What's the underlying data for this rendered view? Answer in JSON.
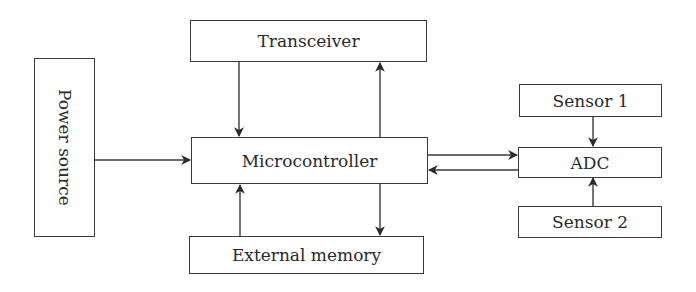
{
  "diagram": {
    "type": "block-diagram",
    "blocks": {
      "power_source": {
        "label": "Power source"
      },
      "transceiver": {
        "label": "Transceiver"
      },
      "microcontroller": {
        "label": "Microcontroller"
      },
      "external_memory": {
        "label": "External memory"
      },
      "sensor1": {
        "label": "Sensor 1"
      },
      "adc": {
        "label": "ADC"
      },
      "sensor2": {
        "label": "Sensor 2"
      }
    },
    "connections": [
      {
        "from": "Power source",
        "to": "Microcontroller"
      },
      {
        "from": "Transceiver",
        "to": "Microcontroller"
      },
      {
        "from": "Microcontroller",
        "to": "Transceiver"
      },
      {
        "from": "External memory",
        "to": "Microcontroller"
      },
      {
        "from": "Microcontroller",
        "to": "External memory"
      },
      {
        "from": "Microcontroller",
        "to": "ADC"
      },
      {
        "from": "ADC",
        "to": "Microcontroller"
      },
      {
        "from": "Sensor 1",
        "to": "ADC"
      },
      {
        "from": "Sensor 2",
        "to": "ADC"
      }
    ]
  }
}
